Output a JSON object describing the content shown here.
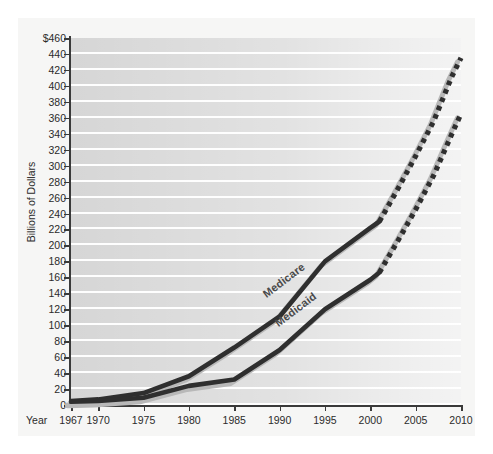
{
  "chart_data": {
    "type": "line",
    "title": "",
    "xlabel": "Year",
    "ylabel": "Billions of Dollars",
    "xlim": [
      1967,
      2010
    ],
    "ylim": [
      0,
      460
    ],
    "ytick_step": 20,
    "grid": true,
    "legend_position": "inline-on-series",
    "x_tick_labels": [
      "1967",
      "1970",
      "1975",
      "1980",
      "1985",
      "1990",
      "1995",
      "2000",
      "2005",
      "2010"
    ],
    "x_tick_values": [
      1967,
      1970,
      1975,
      1980,
      1985,
      1990,
      1995,
      2000,
      2005,
      2010
    ],
    "y_tick_labels": [
      "$460",
      "440",
      "420",
      "400",
      "380",
      "360",
      "340",
      "320",
      "300",
      "280",
      "260",
      "240",
      "220",
      "200",
      "180",
      "160",
      "140",
      "120",
      "100",
      "80",
      "60",
      "40",
      "20",
      "0"
    ],
    "y_tick_values": [
      460,
      440,
      420,
      400,
      380,
      360,
      340,
      320,
      300,
      280,
      260,
      240,
      220,
      200,
      180,
      160,
      140,
      120,
      100,
      80,
      60,
      40,
      20,
      0
    ],
    "projection_starts_at": 2001,
    "annotations": [
      "Medicare",
      "Medicaid"
    ],
    "series": [
      {
        "name": "Medicare",
        "style": "solid-then-dotted",
        "color": "#2f2f2f",
        "x": [
          1967,
          1970,
          1975,
          1980,
          1985,
          1990,
          1995,
          2000,
          2001,
          2003,
          2005,
          2007,
          2009,
          2010
        ],
        "values": [
          5,
          7,
          15,
          36,
          72,
          111,
          180,
          222,
          230,
          270,
          312,
          356,
          412,
          435
        ]
      },
      {
        "name": "Medicaid",
        "style": "solid-then-dotted",
        "color": "#2f2f2f",
        "x": [
          1967,
          1970,
          1975,
          1980,
          1985,
          1990,
          1995,
          2000,
          2001,
          2003,
          2005,
          2007,
          2009,
          2010
        ],
        "values": [
          4,
          5,
          9,
          24,
          32,
          69,
          120,
          157,
          166,
          205,
          245,
          288,
          340,
          365
        ]
      }
    ]
  },
  "axis": {
    "y_label": "Billions of Dollars",
    "x_label": "Year"
  },
  "colors": {
    "line": "#2f2f2f",
    "shadow": "#b8b8b8",
    "plot_band": "#d6d6d6",
    "gridline": "#fefefe",
    "axis": "#3a3a3a",
    "text": "#2b2b2b",
    "page_background": "#f6f6f5"
  }
}
